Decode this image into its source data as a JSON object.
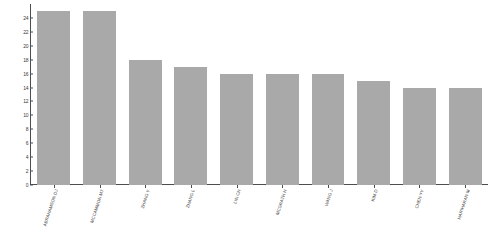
{
  "chart_data": {
    "type": "bar",
    "title": "",
    "subtitle": "",
    "xlabel": "",
    "ylabel": "",
    "categories": [
      "ABRAHAMSON DJ",
      "MCCAMMON MT",
      "ZHANG Y",
      "ZHANG L",
      "LIN CH",
      "MCGRATH H",
      "WANG J",
      "KIM D",
      "CHEN YY",
      "HARIHARAN M"
    ],
    "values": [
      25,
      25,
      18,
      17,
      16,
      16,
      16,
      15,
      14,
      14
    ],
    "ylim": [
      0,
      26
    ],
    "yticks": [
      0,
      2,
      4,
      6,
      8,
      10,
      12,
      14,
      16,
      18,
      20,
      22,
      24
    ],
    "ytick_labels": [
      "0",
      "2",
      "4",
      "6",
      "8",
      "10",
      "12",
      "14",
      "16",
      "18",
      "20",
      "22",
      "24"
    ],
    "grid": false,
    "legend": null,
    "legend_position": "none",
    "bar_color": "#a9a9a9",
    "axis_color": "#4d4d4d",
    "background_color": "#ffffff",
    "label_rotation_degrees": -72
  }
}
